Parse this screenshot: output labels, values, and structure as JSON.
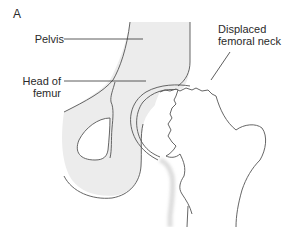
{
  "figure": {
    "panel_label": "A",
    "labels": {
      "pelvis": "Pelvis",
      "head_of_femur_line1": "Head of",
      "head_of_femur_line2": "femur",
      "displaced_neck_line1": "Displaced",
      "displaced_neck_line2": "femoral neck"
    },
    "colors": {
      "bone_fill": "#ececec",
      "femur_fill": "#ffffff",
      "outline": "#555555",
      "leader": "#333333",
      "text": "#2a2a2a"
    }
  }
}
